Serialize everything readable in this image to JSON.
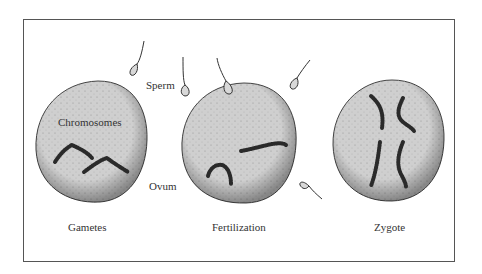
{
  "diagram": {
    "labels": {
      "sperm": "Sperm",
      "chromosomes": "Chromosomes",
      "ovum": "Ovum"
    },
    "stages": [
      {
        "id": "gametes",
        "caption": "Gametes"
      },
      {
        "id": "fertilization",
        "caption": "Fertilization"
      },
      {
        "id": "zygote",
        "caption": "Zygote"
      }
    ],
    "colors": {
      "cell_fill": "#cfcfcf",
      "cell_outline": "#444444",
      "chromosome": "#2a2a2a",
      "frame": "#555555",
      "text": "#333333"
    }
  }
}
